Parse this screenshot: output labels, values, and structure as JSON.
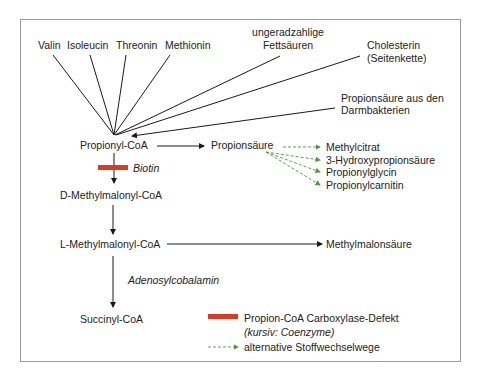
{
  "sources": {
    "valin": "Valin",
    "isoleucin": "Isoleucin",
    "threonin": "Threonin",
    "methionin": "Methionin",
    "fettsaeuren_1": "ungeradzahlige",
    "fettsaeuren_2": "Fettsäuren",
    "cholesterin_1": "Cholesterin",
    "cholesterin_2": "(Seitenkette)",
    "darm_1": "Propionsäure aus den",
    "darm_2": "Darmbakterien"
  },
  "pathway": {
    "propionyl_coa": "Propionyl-CoA",
    "propionsaeure": "Propionsäure",
    "d_methylmalonyl": "D-Methylmalonyl-CoA",
    "l_methylmalonyl": "L-Methylmalonyl-CoA",
    "methylmalonsaeure": "Methylmalonsäure",
    "succinyl_coa": "Succinyl-CoA"
  },
  "coenzymes": {
    "biotin": "Biotin",
    "adenosylcobalamin": "Adenosylcobalamin"
  },
  "alternatives": [
    "Methylcitrat",
    "3-Hydroxypropionsäure",
    "Propionylglycin",
    "Propionylcarnitin"
  ],
  "legend": {
    "defect": "Propion-CoA Carboxylase-Defekt",
    "coenzyme_note": "(kursiv: Coenzyme)",
    "alt_paths": "alternative Stoffwechselwege"
  },
  "colors": {
    "defect": "#e03a1e",
    "alternative": "#4a9a2e",
    "line": "#1a1a1a",
    "frame": "#9a9a9a"
  }
}
